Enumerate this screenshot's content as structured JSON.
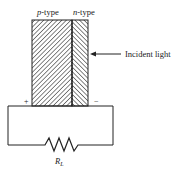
{
  "diagram": {
    "labels": {
      "p_type": "p-type",
      "p_type_italic": "p",
      "p_type_suffix": "-type",
      "n_type": "n-type",
      "n_type_italic": "n",
      "n_type_suffix": "-type",
      "incident_light": "Incident light",
      "plus": "+",
      "minus": "−",
      "resistor": "R",
      "resistor_sub": "L"
    },
    "colors": {
      "line": "#222222",
      "background": "#ffffff"
    }
  }
}
